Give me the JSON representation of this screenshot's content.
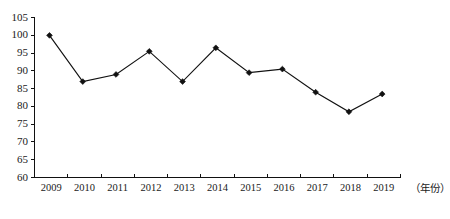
{
  "chart_data": {
    "type": "line",
    "title": "",
    "subtitle": "",
    "xlabel": "（年份）",
    "ylabel": "",
    "categories": [
      "2009",
      "2010",
      "2011",
      "2012",
      "2013",
      "2014",
      "2015",
      "2016",
      "2017",
      "2018",
      "2019"
    ],
    "values": [
      100,
      87,
      89,
      95.5,
      87,
      96.5,
      89.5,
      90.5,
      84,
      78.5,
      83.5
    ],
    "series": [
      {
        "name": "",
        "values": [
          100,
          87,
          89,
          95.5,
          87,
          96.5,
          89.5,
          90.5,
          84,
          78.5,
          83.5
        ]
      }
    ],
    "ylim": [
      60,
      105
    ],
    "ytick_labels": [
      "60",
      "65",
      "70",
      "75",
      "80",
      "85",
      "90",
      "95",
      "100",
      "105"
    ],
    "ytick_values": [
      60,
      65,
      70,
      75,
      80,
      85,
      90,
      95,
      100,
      105
    ],
    "xtick_labels": [
      "2009",
      "2010",
      "2011",
      "2012",
      "2013",
      "2014",
      "2015",
      "2016",
      "2017",
      "2018",
      "2019"
    ],
    "grid": false,
    "legend": false,
    "legend_position": "none",
    "marker": "diamond",
    "line_color": "#111111",
    "marker_color": "#111111",
    "background_color": "#ffffff"
  }
}
